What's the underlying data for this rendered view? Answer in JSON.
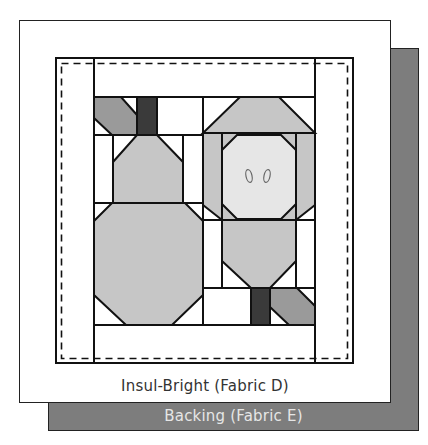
{
  "diagram": {
    "title_partial": "",
    "layers": {
      "insul_bright": {
        "label": "Insul-Bright (Fabric D)",
        "color": "#ffffff"
      },
      "backing": {
        "label": "Backing (Fabric E)",
        "color": "#7d7d7d"
      }
    },
    "quilt_top": {
      "blocks": [
        {
          "name": "pear-block",
          "motif": "pear/bottle with stem and leaf"
        },
        {
          "name": "apple-block",
          "motif": "apple slice with two seeds, stem and leaf"
        }
      ],
      "stitch_line": "dashed",
      "colors": {
        "leaf": "#9a9a9a",
        "stem": "#3a3a3a",
        "fruit": "#c6c6c6",
        "apple_flesh": "#e6e6e6",
        "background": "#ffffff",
        "outline": "#111111"
      }
    }
  }
}
